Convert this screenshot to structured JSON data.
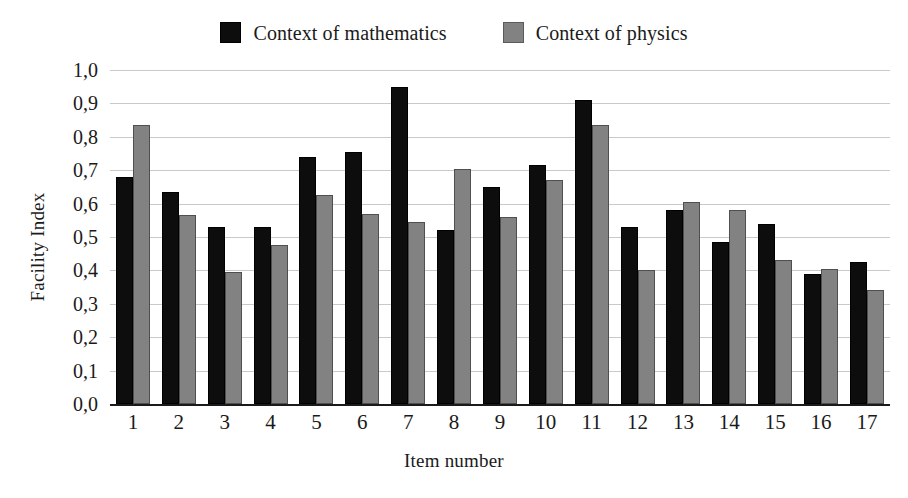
{
  "chart_data": {
    "type": "bar",
    "title": "",
    "xlabel": "Item number",
    "ylabel": "Facility Index",
    "categories": [
      "1",
      "2",
      "3",
      "4",
      "5",
      "6",
      "7",
      "8",
      "9",
      "10",
      "11",
      "12",
      "13",
      "14",
      "15",
      "16",
      "17"
    ],
    "series": [
      {
        "name": "Context of mathematics",
        "color": "#0d0d0d",
        "values": [
          0.68,
          0.635,
          0.53,
          0.53,
          0.74,
          0.755,
          0.95,
          0.52,
          0.65,
          0.715,
          0.91,
          0.53,
          0.58,
          0.485,
          0.54,
          0.39,
          0.425
        ]
      },
      {
        "name": "Context of physics",
        "color": "#828282",
        "values": [
          0.835,
          0.565,
          0.395,
          0.475,
          0.625,
          0.57,
          0.545,
          0.705,
          0.56,
          0.67,
          0.835,
          0.4,
          0.605,
          0.58,
          0.43,
          0.405,
          0.34
        ]
      }
    ],
    "ylim": [
      0.0,
      1.0
    ],
    "ytick_values": [
      1.0,
      0.9,
      0.8,
      0.7,
      0.6,
      0.5,
      0.4,
      0.3,
      0.2,
      0.1,
      0.0
    ],
    "ytick_labels": [
      "1,0",
      "0,9",
      "0,8",
      "0,7",
      "0,6",
      "0,5",
      "0,4",
      "0,3",
      "0,2",
      "0,1",
      "0,0"
    ],
    "grid": true,
    "legend_position": "top-center",
    "decimal_separator": ","
  },
  "legend": {
    "entries": [
      {
        "label": "Context of mathematics",
        "swatch": "black-square-icon"
      },
      {
        "label": "Context of physics",
        "swatch": "gray-square-icon"
      }
    ]
  },
  "axes": {
    "y_title": "Facility Index",
    "x_title": "Item number"
  }
}
